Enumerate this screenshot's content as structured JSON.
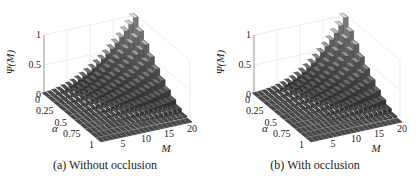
{
  "figure": {
    "captions": [
      "(a) Without occlusion",
      "(b) With occlusion"
    ]
  },
  "chart_data": [
    {
      "type": "bar3d",
      "title": "(a) Without occlusion",
      "xlabel": "M",
      "ylabel": "α",
      "zlabel": "Ψ(M)",
      "x_ticks": [
        "5",
        "10",
        "15",
        "20"
      ],
      "y_ticks": [
        "0",
        "0.25",
        "0.5",
        "0.75",
        "1"
      ],
      "z_ticks": [
        "0",
        "0.5",
        "1"
      ],
      "xlim": [
        0,
        20
      ],
      "ylim": [
        0,
        1
      ],
      "zlim": [
        0,
        1
      ],
      "grid": true,
      "x": [
        1,
        2,
        3,
        4,
        5,
        6,
        7,
        8,
        9,
        10,
        11,
        12,
        13,
        14,
        15,
        16,
        17,
        18,
        19,
        20
      ],
      "y": [
        0,
        0.1,
        0.2,
        0.3,
        0.4,
        0.5,
        0.6,
        0.7,
        0.8,
        0.9,
        1.0
      ],
      "description": "Ψ(M) increases with M and decreases with α; highest (≈1) at α=0, M≈17-20"
    },
    {
      "type": "bar3d",
      "title": "(b) With occlusion",
      "xlabel": "M",
      "ylabel": "α",
      "zlabel": "Ψ(M)",
      "x_ticks": [
        "5",
        "10",
        "15",
        "20"
      ],
      "y_ticks": [
        "0",
        "0.25",
        "0.5",
        "0.75",
        "1"
      ],
      "z_ticks": [
        "0",
        "0.5",
        "1"
      ],
      "xlim": [
        0,
        20
      ],
      "ylim": [
        0,
        1
      ],
      "zlim": [
        0,
        1
      ],
      "grid": true,
      "x": [
        1,
        2,
        3,
        4,
        5,
        6,
        7,
        8,
        9,
        10,
        11,
        12,
        13,
        14,
        15,
        16,
        17,
        18,
        19,
        20
      ],
      "y": [
        0,
        0.1,
        0.2,
        0.3,
        0.4,
        0.5,
        0.6,
        0.7,
        0.8,
        0.9,
        1.0
      ],
      "description": "Similar surface to (a) but rises slightly more gradually with M"
    }
  ]
}
